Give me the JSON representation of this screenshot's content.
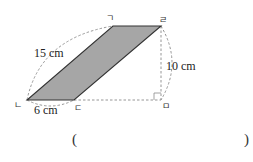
{
  "figure": {
    "shape": "parallelogram",
    "fill_color": "#a6a6a6",
    "edge_color": "#333333",
    "guide_color": "#8a8a8a",
    "vertices": {
      "top_left": "ㄱ",
      "bottom_left": "ㄴ",
      "bottom_right": "ㄷ",
      "top_right": "ㄹ",
      "foot_of_height": "ㅁ"
    },
    "measurements": {
      "diagonal_side": "15 cm",
      "height": "10 cm",
      "base": "6 cm"
    },
    "right_angle_marker": true
  },
  "answer": {
    "open": "(",
    "close": ")",
    "value": ""
  }
}
